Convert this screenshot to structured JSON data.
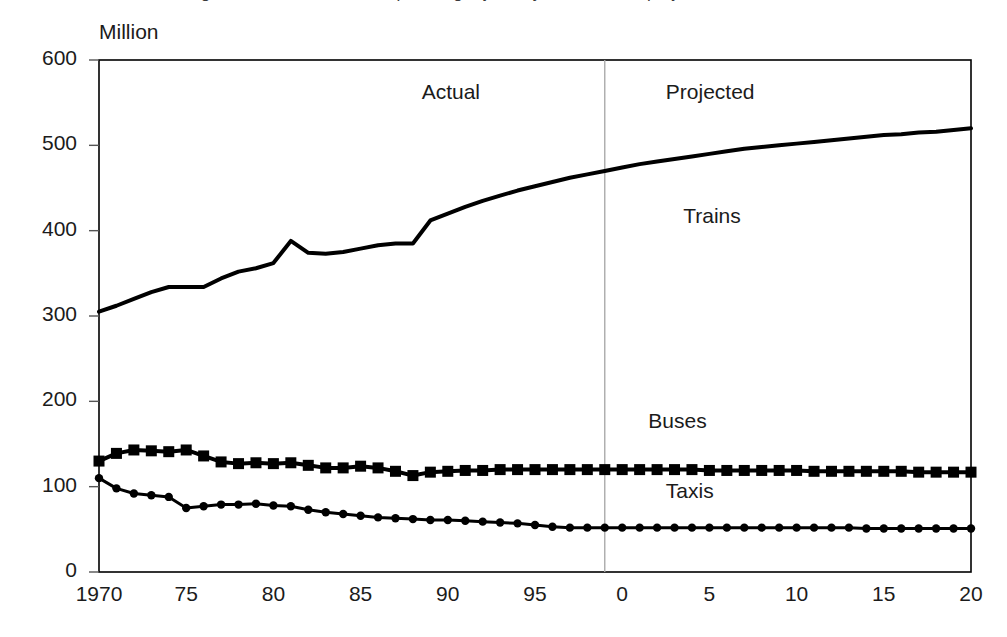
{
  "figure": {
    "clipped_title_fragment": "Figure 1 Rail, bus and taxi passenger journeys, actual and projected",
    "background_color": "#ffffff",
    "ink_color": "#000000",
    "divider_color": "#aaaaaa"
  },
  "chart_data": {
    "type": "line",
    "title": "",
    "xlabel": "",
    "ylabel": "Million",
    "xlim": [
      1970,
      2020
    ],
    "ylim": [
      0,
      600
    ],
    "grid": false,
    "legend_position": "inline-labels",
    "y_ticks": [
      0,
      100,
      200,
      300,
      400,
      500,
      600
    ],
    "y_tick_labels": [
      "0",
      "100",
      "200",
      "300",
      "400",
      "500",
      "600"
    ],
    "x_ticks": [
      1970,
      1975,
      1980,
      1985,
      1990,
      1995,
      2000,
      2005,
      2010,
      2015,
      2020
    ],
    "x_tick_labels": [
      "1970",
      "75",
      "80",
      "85",
      "90",
      "95",
      "0",
      "5",
      "10",
      "15",
      "20"
    ],
    "annotations": [
      {
        "text": "Actual",
        "x": 1988.5,
        "y": 560
      },
      {
        "text": "Projected",
        "x": 2002.5,
        "y": 560
      },
      {
        "text": "Trains",
        "x": 2003.5,
        "y": 415
      },
      {
        "text": "Buses",
        "x": 2001.5,
        "y": 175
      },
      {
        "text": "Taxis",
        "x": 2002.5,
        "y": 92
      }
    ],
    "divider": {
      "x": 1999,
      "label_left": "Actual",
      "label_right": "Projected"
    },
    "x": [
      1970,
      1971,
      1972,
      1973,
      1974,
      1975,
      1976,
      1977,
      1978,
      1979,
      1980,
      1981,
      1982,
      1983,
      1984,
      1985,
      1986,
      1987,
      1988,
      1989,
      1990,
      1991,
      1992,
      1993,
      1994,
      1995,
      1996,
      1997,
      1998,
      1999,
      2000,
      2001,
      2002,
      2003,
      2004,
      2005,
      2006,
      2007,
      2008,
      2009,
      2010,
      2011,
      2012,
      2013,
      2014,
      2015,
      2016,
      2017,
      2018,
      2019,
      2020
    ],
    "series": [
      {
        "name": "Trains",
        "marker": "none",
        "line_width": 4,
        "color": "#000000",
        "values": [
          305,
          312,
          320,
          328,
          334,
          334,
          334,
          344,
          352,
          356,
          362,
          388,
          374,
          373,
          375,
          379,
          383,
          385,
          385,
          412,
          420,
          428,
          435,
          441,
          447,
          452,
          457,
          462,
          466,
          470,
          474,
          478,
          481,
          484,
          487,
          490,
          493,
          496,
          498,
          500,
          502,
          504,
          506,
          508,
          510,
          512,
          513,
          515,
          516,
          518,
          520
        ]
      },
      {
        "name": "Buses",
        "marker": "square",
        "line_width": 4,
        "color": "#000000",
        "values": [
          130,
          139,
          143,
          142,
          141,
          143,
          136,
          129,
          127,
          128,
          127,
          128,
          125,
          122,
          122,
          124,
          122,
          118,
          113,
          117,
          118,
          119,
          119,
          120,
          120,
          120,
          120,
          120,
          120,
          120,
          120,
          120,
          120,
          120,
          120,
          119,
          119,
          119,
          119,
          119,
          119,
          118,
          118,
          118,
          118,
          118,
          118,
          117,
          117,
          117,
          117
        ]
      },
      {
        "name": "Taxis",
        "marker": "circle",
        "line_width": 3,
        "color": "#000000",
        "values": [
          110,
          98,
          92,
          90,
          88,
          75,
          77,
          79,
          79,
          80,
          78,
          77,
          73,
          70,
          68,
          66,
          64,
          63,
          62,
          61,
          61,
          60,
          59,
          58,
          57,
          55,
          53,
          52,
          52,
          52,
          52,
          52,
          52,
          52,
          52,
          52,
          52,
          52,
          52,
          52,
          52,
          52,
          52,
          52,
          51,
          51,
          51,
          51,
          51,
          51,
          51
        ]
      }
    ]
  }
}
